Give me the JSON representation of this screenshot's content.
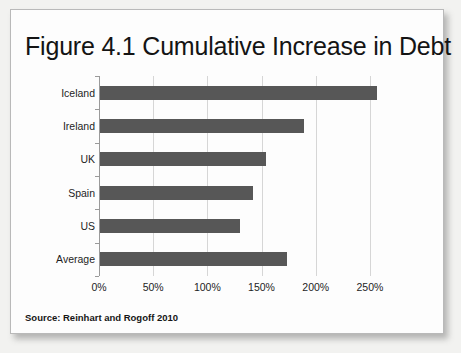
{
  "figure": {
    "title": "Figure 4.1 Cumulative Increase in Debt",
    "source": "Source:  Reinhart and Rogoff 2010"
  },
  "chart_data": {
    "type": "bar",
    "orientation": "horizontal",
    "title": "Figure 4.1 Cumulative Increase in Debt",
    "xlabel": "",
    "ylabel": "",
    "categories": [
      "Iceland",
      "Ireland",
      "UK",
      "Spain",
      "US",
      "Average"
    ],
    "values": [
      256,
      188,
      153,
      141,
      129,
      173
    ],
    "value_unit": "%",
    "xlim": [
      0,
      275
    ],
    "xticks": [
      0,
      50,
      100,
      150,
      200,
      250
    ],
    "xtick_labels": [
      "0%",
      "50%",
      "100%",
      "150%",
      "200%",
      "250%"
    ],
    "grid": "vertical",
    "legend": "none",
    "bar_color": "#575757",
    "gridline_color": "#d6d6d6",
    "annotations": [
      "Source:  Reinhart and Rogoff 2010"
    ]
  }
}
